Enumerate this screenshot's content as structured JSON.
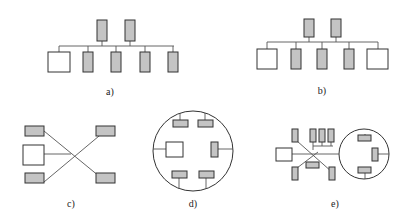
{
  "figure": {
    "panels": [
      {
        "id": "a",
        "label": "a)",
        "topology": "bus with two top devices and five bottom devices (one host)"
      },
      {
        "id": "b",
        "label": "b)",
        "topology": "bus with two top devices and five bottom devices (two hosts)"
      },
      {
        "id": "c",
        "label": "c)",
        "topology": "star crossing with host and four devices"
      },
      {
        "id": "d",
        "label": "d)",
        "topology": "ring with host and five devices"
      },
      {
        "id": "e",
        "label": "e)",
        "topology": "hybrid: star/bus segment connected to ring"
      }
    ],
    "colors": {
      "device_fill": "#c4c4c4",
      "host_fill": "#ffffff",
      "stroke": "#333333",
      "wire": "#555555"
    }
  }
}
